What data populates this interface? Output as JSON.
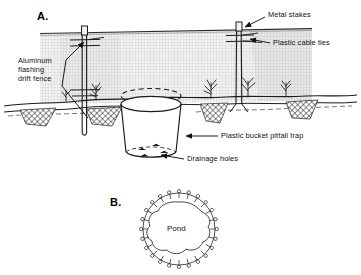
{
  "figure": {
    "type": "scientific-diagram",
    "background_color": "#ffffff",
    "line_color": "#111111",
    "fence_mesh_color": "#b8b8b8",
    "soil_hatch_color": "#333333"
  },
  "panels": [
    {
      "id": "A",
      "letter": "A.",
      "view": "cross-section elevation of drift fence with buried pitfall bucket"
    },
    {
      "id": "B",
      "letter": "B.",
      "view": "plan view of circular drift fence array encircling a pond"
    }
  ],
  "labels": {
    "aluminum_flashing": "Aluminum\nflashing\ndrift fence",
    "metal_stakes": "Metal stakes",
    "plastic_cable_ties": "Plastic cable ties",
    "plastic_bucket": "Plastic bucket pitfall trap",
    "drainage_holes": "Drainage holes",
    "pond": "Pond"
  },
  "panel_b": {
    "trap_count": 24,
    "pond_label": "Pond"
  }
}
